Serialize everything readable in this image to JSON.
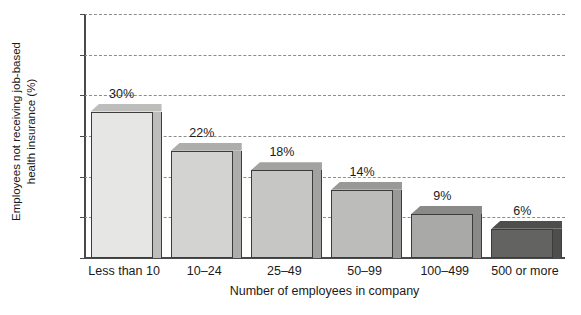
{
  "chart_data": {
    "type": "bar",
    "title": "",
    "xlabel": "Number of employees in company",
    "ylabel_line1": "Employees not receiving job-based",
    "ylabel_line2": "health insurance (%)",
    "categories": [
      "Less than 10",
      "10–24",
      "25–49",
      "50–99",
      "100–499",
      "500 or more"
    ],
    "values": [
      30,
      22,
      18,
      14,
      9,
      6
    ],
    "value_labels": [
      "30%",
      "22%",
      "18%",
      "14%",
      "9%",
      "6%"
    ],
    "ylim": [
      0,
      50
    ],
    "ytick_labels": [
      "50",
      "45",
      "35",
      "25",
      "15",
      "5",
      "0"
    ],
    "grid": true,
    "legend": "none",
    "bar_colors": [
      "#e6e6e4",
      "#d3d3d1",
      "#c6c6c4",
      "#bcbcba",
      "#a9a9a7",
      "#636361"
    ],
    "bar_side_colors": [
      "#bdbdbb",
      "#adadab",
      "#a2a2a0",
      "#999997",
      "#8a8a88",
      "#4e4e4c"
    ],
    "axis_color": "#4a4a4a",
    "grid_color": "#8c8c8c"
  },
  "caption": {
    "sliver_text": ""
  }
}
